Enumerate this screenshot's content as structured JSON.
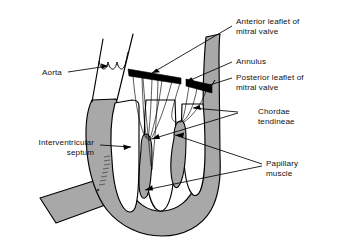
{
  "figure": {
    "background_color": "#ffffff",
    "myocardium_color": "#a8a8a8",
    "leaflet_color": "#000000",
    "outline_color": "#000000",
    "cavity_color": "#ffffff"
  },
  "labels": {
    "aorta": {
      "line1": "Aorta",
      "line2": ""
    },
    "anterior_leaflet": {
      "line1": "Anterior leaflet of",
      "line2": "mitral valve"
    },
    "annulus": {
      "line1": "Annulus",
      "line2": ""
    },
    "posterior_leaflet": {
      "line1": "Posterior leaflet of",
      "line2": "mitral valve"
    },
    "chordae": {
      "line1": "Chordae",
      "line2": "tendineae"
    },
    "papillary": {
      "line1": "Papillary",
      "line2": "muscle"
    },
    "septum": {
      "line1": "Interventricular",
      "line2": "septum"
    }
  },
  "structures": [
    {
      "name": "aorta",
      "description": "Aortic root with three scalloped valve cusps"
    },
    {
      "name": "anterior-leaflet",
      "description": "Black wedge-shaped anterior mitral leaflet"
    },
    {
      "name": "posterior-leaflet",
      "description": "Black wedge-shaped posterior mitral leaflet"
    },
    {
      "name": "annulus",
      "description": "Mitral annulus at leaflet hinge points"
    },
    {
      "name": "chordae-tendineae",
      "description": "Thin fibrous cords from leaflet edges to papillary tips"
    },
    {
      "name": "papillary-muscle-anterolateral",
      "description": "Finger-like muscle projecting from ventricular wall"
    },
    {
      "name": "papillary-muscle-posteromedial",
      "description": "Finger-like muscle projecting from ventricular wall"
    },
    {
      "name": "interventricular-septum",
      "description": "Thick gray wall dividing the ventricles"
    },
    {
      "name": "ventricular-cavity",
      "description": "White left ventricular chamber"
    },
    {
      "name": "right-ventricle-wall",
      "description": "Gray band extending to lower left"
    }
  ]
}
